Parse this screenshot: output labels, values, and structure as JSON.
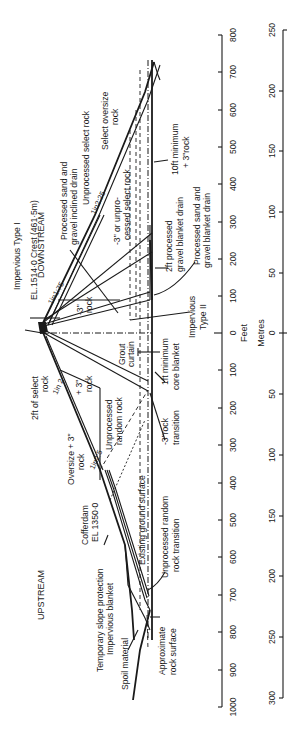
{
  "diagram": {
    "type": "embankment dam cross-section (rotated 90°)",
    "regions": {
      "downstream": "DOWNSTREAM",
      "upstream": "UPSTREAM"
    },
    "labels": {
      "impervious_type_1": "Impervious Type I",
      "crest": "EL.1514·0 Crest (461·5m)",
      "slope_ds_crest": "1in1:75",
      "processed_sand_inclined": "Processed sand and",
      "processed_sand_inclined_2": "gravel inclined drain",
      "unprocessed_select": "Unprocessed select rock",
      "slope_ds": "1in2:25",
      "select_oversize": "Select oversize",
      "select_oversize_2": "rock",
      "minus3_unprocessed": "-3\" or unpro-",
      "minus3_unprocessed_2": "cessed select rock",
      "minus3_rock": "-3\"",
      "minus3_rock_2": "rock",
      "ten_ft_min": "10ft minimum",
      "ten_ft_min_2": "+ 3\"rock",
      "two_ft_processed": "2ft processed",
      "two_ft_processed_2": "gravel blanket drain",
      "processed_blanket": "Processed sand and",
      "processed_blanket_2": "gravel blanket drain",
      "impervious_type_2": "Impervious",
      "impervious_type_2b": "Type II",
      "grout_curtain": "Grout",
      "grout_curtain_2": "curtain",
      "one_ft_min": "1ft minimum",
      "one_ft_min_2": "core blanket",
      "two_ft_select": "2ft of select",
      "two_ft_select_2": "rock",
      "slope_us_upper": "1in 2",
      "plus3_rock": "+ 3\"",
      "plus3_rock_2": "rock",
      "unprocessed_random": "Unprocessed",
      "unprocessed_random_2": "random rock",
      "minus3_transition": "-3\"rock",
      "minus3_transition_2": "transition",
      "oversize": "Oversize + 3\"",
      "oversize_2": "rock",
      "slope_us": "1in2:5",
      "cofferdam": "Cofferdam",
      "cofferdam_el": "EL 1350·0",
      "existing_ground": "Existing ground surface",
      "unprocessed_transition": "Unprocessed random",
      "unprocessed_transition_2": "rock transition",
      "temp_slope": "Temporary slope protection",
      "impervious_blanket": "Impervious blanket",
      "spoil": "Spoil material",
      "approx_rock": "Approximate",
      "approx_rock_2": "rock surface"
    },
    "scales": {
      "feet": {
        "label": "Feet",
        "ticks": [
          "800",
          "700",
          "600",
          "500",
          "400",
          "300",
          "200",
          "100",
          "0",
          "100",
          "200",
          "300",
          "400",
          "500",
          "600",
          "700",
          "800",
          "900",
          "1000"
        ]
      },
      "metres": {
        "label": "Metres",
        "ticks": [
          "250",
          "200",
          "150",
          "100",
          "50",
          "0",
          "50",
          "100",
          "150",
          "200",
          "250",
          "300"
        ]
      }
    }
  }
}
